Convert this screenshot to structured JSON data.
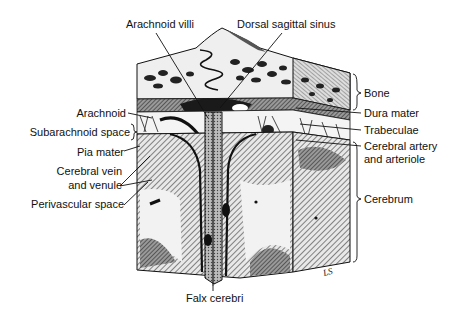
{
  "figure": {
    "artist_initials": "LS",
    "colors": {
      "ink": "#111111",
      "bone_fill": "#efefef",
      "dark_fill": "#2a2a2a",
      "hatch": "#555555",
      "background": "#ffffff"
    }
  },
  "labels": {
    "top": [
      {
        "id": "arachnoid-villi",
        "text": "Arachnoid villi"
      },
      {
        "id": "dorsal-sagittal-sinus",
        "text": "Dorsal sagittal sinus"
      }
    ],
    "right": [
      {
        "id": "bone",
        "text": "Bone"
      },
      {
        "id": "dura-mater",
        "text": "Dura mater"
      },
      {
        "id": "trabeculae",
        "text": "Trabeculae"
      },
      {
        "id": "cerebral-artery",
        "line1": "Cerebral artery",
        "line2": "and arteriole"
      },
      {
        "id": "cerebrum",
        "text": "Cerebrum"
      }
    ],
    "left": [
      {
        "id": "arachnoid",
        "text": "Arachnoid"
      },
      {
        "id": "subarachnoid-space",
        "text": "Subarachnoid space"
      },
      {
        "id": "pia-mater",
        "text": "Pia mater"
      },
      {
        "id": "cerebral-vein",
        "line1": "Cerebral vein",
        "line2": "and venule"
      },
      {
        "id": "perivascular-space",
        "text": "Perivascular space"
      }
    ],
    "bottom": [
      {
        "id": "falx-cerebri",
        "text": "Falx cerebri"
      }
    ]
  }
}
